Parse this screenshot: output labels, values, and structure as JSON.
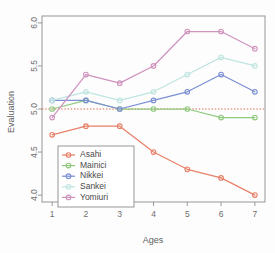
{
  "chart_data": {
    "type": "line",
    "title": "",
    "xlabel": "Ages",
    "ylabel": "Evaluation",
    "x": [
      1,
      2,
      3,
      4,
      5,
      6,
      7
    ],
    "xticklabels": [
      "1",
      "2",
      "3",
      "4",
      "5",
      "6",
      "7"
    ],
    "yticklabels": [
      "4.0",
      "4.5",
      "5.0",
      "5.5",
      "6.0"
    ],
    "yticks": [
      4.0,
      4.5,
      5.0,
      5.5,
      6.0
    ],
    "xlim": [
      0.7,
      7.3
    ],
    "ylim": [
      3.92,
      6.08
    ],
    "grid": false,
    "legend_position": "bottom-left",
    "reference_line": {
      "y": 5.0,
      "style": "dotted",
      "color": "#d9694a"
    },
    "series": [
      {
        "name": "Asahi",
        "color": "#e8806a",
        "values": [
          4.7,
          4.8,
          4.8,
          4.5,
          4.3,
          4.2,
          4.0
        ]
      },
      {
        "name": "Mainici",
        "color": "#8fc97e",
        "values": [
          5.0,
          5.1,
          5.0,
          5.0,
          5.0,
          4.9,
          4.9
        ]
      },
      {
        "name": "Nikkei",
        "color": "#7b8fd4",
        "values": [
          5.1,
          5.1,
          5.0,
          5.1,
          5.2,
          5.4,
          5.2
        ]
      },
      {
        "name": "Sankei",
        "color": "#bfe5e0",
        "values": [
          5.1,
          5.2,
          5.1,
          5.2,
          5.4,
          5.6,
          5.5
        ]
      },
      {
        "name": "Yomiuri",
        "color": "#cf93bd",
        "values": [
          4.9,
          5.4,
          5.3,
          5.5,
          5.9,
          5.9,
          5.7
        ]
      }
    ]
  }
}
